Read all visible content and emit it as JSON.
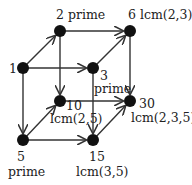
{
  "diagram": {
    "type": "divisor-lattice-cube",
    "nodes": [
      {
        "id": "1",
        "x": 23,
        "y": 68,
        "labels": [
          "1"
        ],
        "label_pos": [
          {
            "x": 9,
            "y": 73
          }
        ]
      },
      {
        "id": "2",
        "x": 60,
        "y": 31,
        "labels": [
          "2  prime"
        ],
        "label_pos": [
          {
            "x": 56,
            "y": 19
          }
        ]
      },
      {
        "id": "6",
        "x": 130,
        "y": 31,
        "labels": [
          "6  lcm(2,3)"
        ],
        "label_pos": [
          {
            "x": 128,
            "y": 19
          }
        ]
      },
      {
        "id": "3",
        "x": 93,
        "y": 68,
        "labels": [
          "3",
          "prime"
        ],
        "label_pos": [
          {
            "x": 100,
            "y": 80
          },
          {
            "x": 94,
            "y": 93
          }
        ]
      },
      {
        "id": "10",
        "x": 60,
        "y": 101,
        "labels": [
          "10",
          "lcm(2,5)"
        ],
        "label_pos": [
          {
            "x": 66,
            "y": 110
          },
          {
            "x": 50,
            "y": 123
          }
        ]
      },
      {
        "id": "30",
        "x": 130,
        "y": 101,
        "labels": [
          "30",
          "lcm(2,3,5)"
        ],
        "label_pos": [
          {
            "x": 139,
            "y": 108
          },
          {
            "x": 131,
            "y": 122
          }
        ]
      },
      {
        "id": "5",
        "x": 23,
        "y": 140,
        "labels": [
          "5",
          "prime"
        ],
        "label_pos": [
          {
            "x": 17,
            "y": 161
          },
          {
            "x": 8,
            "y": 176
          }
        ]
      },
      {
        "id": "15",
        "x": 93,
        "y": 140,
        "labels": [
          "15",
          "lcm(3,5)"
        ],
        "label_pos": [
          {
            "x": 89,
            "y": 161
          },
          {
            "x": 76,
            "y": 176
          }
        ]
      }
    ],
    "edges": [
      {
        "from": "1",
        "to": "2"
      },
      {
        "from": "1",
        "to": "3"
      },
      {
        "from": "1",
        "to": "5"
      },
      {
        "from": "2",
        "to": "6"
      },
      {
        "from": "2",
        "to": "10"
      },
      {
        "from": "3",
        "to": "6"
      },
      {
        "from": "3",
        "to": "15"
      },
      {
        "from": "5",
        "to": "10"
      },
      {
        "from": "5",
        "to": "15"
      },
      {
        "from": "6",
        "to": "30"
      },
      {
        "from": "10",
        "to": "30"
      },
      {
        "from": "15",
        "to": "30"
      }
    ],
    "colors": {
      "node": "#111111",
      "edge": "#333333",
      "text": "#222222",
      "background": "#ffffff"
    }
  }
}
